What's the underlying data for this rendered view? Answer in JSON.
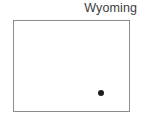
{
  "figure": {
    "type": "state-locator-map",
    "width": 143,
    "height": 126,
    "background_color": "#ffffff"
  },
  "title": {
    "text": "Wyoming",
    "color": "#3c3c3c",
    "align": "right"
  },
  "state_outline": {
    "name": "Wyoming",
    "shape": "rectangle",
    "border_color": "#8c8c8c",
    "fill_color": "#ffffff",
    "border_width_px": 1,
    "bounds": {
      "x": 13,
      "y": 20,
      "width": 117,
      "height": 92
    }
  },
  "markers": [
    {
      "name": "location-marker",
      "shape": "circle",
      "color": "#1c1c1c",
      "diameter_px": 6,
      "center": {
        "x": 87,
        "y": 72
      }
    }
  ]
}
